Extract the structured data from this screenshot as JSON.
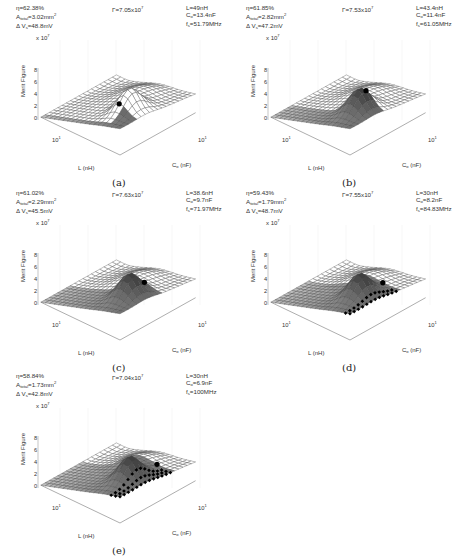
{
  "chart_data": [
    {
      "type": "surface3d",
      "panel": "(a)",
      "zlabel": "Merit Figure",
      "zscale": "x 10^7",
      "zticks": [
        0,
        2,
        4,
        6,
        8
      ],
      "xlabel": "L (nH)",
      "ylabel": "C_o (nF)",
      "xtick": "10^1",
      "ytick": "10^1",
      "annotations": {
        "eta": "η=62.38%",
        "area": "A_total=3.02mm²",
        "dv": "ΔV_s=48.8mV",
        "gamma": "Γ=7.05x10^7",
        "L": "L=49nH",
        "Co": "C_o=13.4nF",
        "fs": "f_s=51.79MHz"
      },
      "marker": {
        "label": "optimum",
        "shape": "dot"
      },
      "shaded_region": "small lower-right region"
    },
    {
      "type": "surface3d",
      "panel": "(b)",
      "zlabel": "Merit Figure",
      "zscale": "x 10^7",
      "zticks": [
        0,
        2,
        4,
        6,
        8
      ],
      "xlabel": "L (nH)",
      "ylabel": "C_o (nF)",
      "xtick": "10^1",
      "ytick": "10^1",
      "annotations": {
        "eta": "η=61.85%",
        "area": "A_total=2.82mm²",
        "dv": "ΔV_s=47.2mV",
        "gamma": "Γ=7.53x10^7",
        "L": "L=43.4nH",
        "Co": "C_o=11.4nF",
        "fs": "f_s=61.05MHz"
      },
      "marker": {
        "label": "optimum",
        "shape": "dot"
      }
    },
    {
      "type": "surface3d",
      "panel": "(c)",
      "zlabel": "Merit Figure",
      "zscale": "x 10^7",
      "zticks": [
        0,
        2,
        4,
        6,
        8
      ],
      "xlabel": "L (nH)",
      "ylabel": "C_o (nF)",
      "xtick": "10^1",
      "ytick": "10^1",
      "annotations": {
        "eta": "η=61.02%",
        "area": "A_total=2.29mm²",
        "dv": "ΔV_s=45.5mV",
        "gamma": "Γ=7.63x10^7",
        "L": "L=38.6nH",
        "Co": "C_o=9.7nF",
        "fs": "f_s=71.97MHz"
      },
      "marker": {
        "label": "optimum",
        "shape": "dot"
      }
    },
    {
      "type": "surface3d",
      "panel": "(d)",
      "zlabel": "Merit Figure",
      "zscale": "x 10^7",
      "zticks": [
        0,
        2,
        4,
        6,
        8
      ],
      "xlabel": "L (nH)",
      "ylabel": "C_o (nF)",
      "xtick": "10^1",
      "ytick": "10^1",
      "annotations": {
        "eta": "η=59.43%",
        "area": "A_total=1.79mm²",
        "dv": "ΔV_s=48.7mV",
        "gamma": "Γ=7.55x10^7",
        "L": "L=30nH",
        "Co": "C_o=8.2nF",
        "fs": "f_s=84.83MHz"
      },
      "marker": {
        "label": "optimum",
        "shape": "dot"
      },
      "boundary_markers": "diamond markers along constraint edge"
    },
    {
      "type": "surface3d",
      "panel": "(e)",
      "zlabel": "Merit Figure",
      "zscale": "x 10^7",
      "zticks": [
        0,
        2,
        4,
        6,
        8
      ],
      "xlabel": "L (nH)",
      "ylabel": "C_o (nF)",
      "xtick": "10^1",
      "ytick": "10^1",
      "annotations": {
        "eta": "η=58.84%",
        "area": "A_total=1.73mm²",
        "dv": "ΔV_s=42.8mV",
        "gamma": "Γ=7.04x10^7",
        "L": "L=30nH",
        "Co": "C_o=6.9nF",
        "fs": "f_s=100MHz"
      },
      "marker": {
        "label": "optimum",
        "shape": "dot"
      },
      "boundary_markers": "diamond markers along constraint edge"
    }
  ],
  "panels": [
    {
      "caption": "(a)",
      "eta": "η=62.38%",
      "area_pre": "A",
      "area_sub": "total",
      "area_val": "=3.02mm",
      "dv_pre": "Δ V",
      "dv_sub": "s",
      "dv_val": "=48.8mV",
      "gamma": "Γ=7.05x10",
      "gamma_exp": "7",
      "L": "L=49nH",
      "Co_pre": "C",
      "Co_sub": "o",
      "Co_val": "=13.4nF",
      "fs_pre": "f",
      "fs_sub": "s",
      "fs_val": "=51.79MHz"
    },
    {
      "caption": "(b)",
      "eta": "η=61.85%",
      "area_pre": "A",
      "area_sub": "total",
      "area_val": "=2.82mm",
      "dv_pre": "Δ V",
      "dv_sub": "s",
      "dv_val": "=47.2mV",
      "gamma": "Γ=7.53x10",
      "gamma_exp": "7",
      "L": "L=43.4nH",
      "Co_pre": "C",
      "Co_sub": "o",
      "Co_val": "=11.4nF",
      "fs_pre": "f",
      "fs_sub": "s",
      "fs_val": "=61.05MHz"
    },
    {
      "caption": "(c)",
      "eta": "η=61.02%",
      "area_pre": "A",
      "area_sub": "total",
      "area_val": "=2.29mm",
      "dv_pre": "Δ V",
      "dv_sub": "s",
      "dv_val": "=45.5mV",
      "gamma": "Γ=7.63x10",
      "gamma_exp": "7",
      "L": "L=38.6nH",
      "Co_pre": "C",
      "Co_sub": "o",
      "Co_val": "=9.7nF",
      "fs_pre": "f",
      "fs_sub": "s",
      "fs_val": "=71.97MHz"
    },
    {
      "caption": "(d)",
      "eta": "η=59.43%",
      "area_pre": "A",
      "area_sub": "total",
      "area_val": "=1.79mm",
      "dv_pre": "Δ V",
      "dv_sub": "s",
      "dv_val": "=48.7mV",
      "gamma": "Γ=7.55x10",
      "gamma_exp": "7",
      "L": "L=30nH",
      "Co_pre": "C",
      "Co_sub": "o",
      "Co_val": "=8.2nF",
      "fs_pre": "f",
      "fs_sub": "s",
      "fs_val": "=84.83MHz"
    },
    {
      "caption": "(e)",
      "eta": "η=58.84%",
      "area_pre": "A",
      "area_sub": "total",
      "area_val": "=1.73mm",
      "dv_pre": "Δ V",
      "dv_sub": "s",
      "dv_val": "=42.8mV",
      "gamma": "Γ=7.04x10",
      "gamma_exp": "7",
      "L": "L=30nH",
      "Co_pre": "C",
      "Co_sub": "o",
      "Co_val": "=6.9nF",
      "fs_pre": "f",
      "fs_sub": "s",
      "fs_val": "=100MHz"
    }
  ],
  "common": {
    "zlabel": "Merit Figure",
    "zscale_base": "x 10",
    "zscale_exp": "7",
    "zticks": [
      "8",
      "6",
      "4",
      "2",
      "0"
    ],
    "xlabel": "L (nH)",
    "ylabel_pre": "C",
    "ylabel_sub": "o",
    "ylabel_post": " (nF)",
    "tick_base": "10",
    "tick_exp": "1",
    "sup2": "2"
  }
}
